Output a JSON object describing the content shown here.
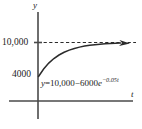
{
  "chart_data": {
    "type": "line",
    "title": "",
    "xlabel": "t",
    "ylabel": "y",
    "equation_plain": "y = 10,000 - 6000e^(-0.05t)",
    "equation_parts": {
      "lhs": "y",
      "equals": "=",
      "constant": "10,000",
      "minus": "−",
      "coefficient": "6000",
      "base": "e",
      "exponent": "−0.05t"
    },
    "y_tick_labels": [
      "10,000",
      "4000"
    ],
    "y_tick_values": [
      10000,
      4000
    ],
    "x_tick_labels": [],
    "xlim": [
      0,
      100
    ],
    "ylim": [
      0,
      12000
    ],
    "grid": false,
    "legend_position": "none",
    "asymptote": {
      "value": 10000,
      "label": "10,000",
      "style": "dashed"
    },
    "initial_value": 4000,
    "x": [
      0,
      5,
      10,
      15,
      20,
      25,
      30,
      35,
      40,
      45,
      50,
      55,
      60,
      65,
      70,
      75,
      80
    ],
    "values": [
      4000,
      5328,
      6361,
      7166,
      7792,
      8280,
      8659,
      8954,
      9184,
      9364,
      9507,
      9615,
      9701,
      9767,
      9819,
      9859,
      9890
    ],
    "annotations": [
      {
        "name": "curve-arrow",
        "text": "",
        "description": "arrowhead at right end of curve indicating approach to asymptote"
      }
    ]
  }
}
